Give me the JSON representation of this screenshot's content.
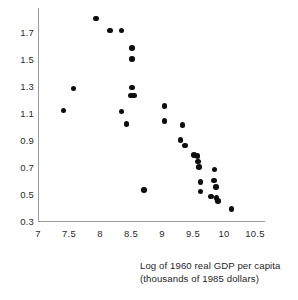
{
  "chart_data": {
    "type": "scatter",
    "title": "",
    "xlabel": "Log of 1960 real GDP per capita (thousands of 1985 dollars)",
    "ylabel": "",
    "xlim": [
      7,
      10.5
    ],
    "ylim": [
      0.3,
      1.7
    ],
    "grid": false,
    "legend": null,
    "xticks": [
      "7",
      "7.5",
      "8",
      "8.5",
      "9",
      "9.5",
      "10",
      "10.5"
    ],
    "xtick_values": [
      7,
      7.5,
      8,
      8.5,
      9,
      9.5,
      10,
      10.5
    ],
    "yticks": [
      "1.7",
      "1.5",
      "1.3",
      "1.1",
      "0.9",
      "0.7",
      "0.5",
      "0.3"
    ],
    "ytick_values": [
      1.7,
      1.5,
      1.3,
      1.1,
      0.9,
      0.7,
      0.5,
      0.3
    ],
    "marker": "filled-circle",
    "marker_color": "#0d0d0d",
    "points": [
      {
        "x": 7.41,
        "y": 1.12
      },
      {
        "x": 7.57,
        "y": 1.28
      },
      {
        "x": 7.94,
        "y": 1.8
      },
      {
        "x": 8.16,
        "y": 1.71
      },
      {
        "x": 8.35,
        "y": 1.71
      },
      {
        "x": 8.52,
        "y": 1.58
      },
      {
        "x": 8.52,
        "y": 1.5
      },
      {
        "x": 8.35,
        "y": 1.11
      },
      {
        "x": 8.43,
        "y": 1.02
      },
      {
        "x": 8.52,
        "y": 1.29
      },
      {
        "x": 8.5,
        "y": 1.23
      },
      {
        "x": 8.55,
        "y": 1.23
      },
      {
        "x": 8.71,
        "y": 0.53
      },
      {
        "x": 9.04,
        "y": 1.15
      },
      {
        "x": 9.04,
        "y": 1.04
      },
      {
        "x": 9.33,
        "y": 1.01
      },
      {
        "x": 9.3,
        "y": 0.9
      },
      {
        "x": 9.37,
        "y": 0.86
      },
      {
        "x": 9.52,
        "y": 0.79
      },
      {
        "x": 9.57,
        "y": 0.78
      },
      {
        "x": 9.58,
        "y": 0.74
      },
      {
        "x": 9.6,
        "y": 0.7
      },
      {
        "x": 9.85,
        "y": 0.68
      },
      {
        "x": 9.62,
        "y": 0.59
      },
      {
        "x": 9.84,
        "y": 0.6
      },
      {
        "x": 9.62,
        "y": 0.52
      },
      {
        "x": 9.87,
        "y": 0.55
      },
      {
        "x": 9.79,
        "y": 0.48
      },
      {
        "x": 9.88,
        "y": 0.47
      },
      {
        "x": 9.9,
        "y": 0.45
      },
      {
        "x": 10.12,
        "y": 0.39
      }
    ]
  },
  "caption": {
    "line1": "Log of 1960 real GDP per capita",
    "line2": "(thousands of 1985 dollars)"
  }
}
